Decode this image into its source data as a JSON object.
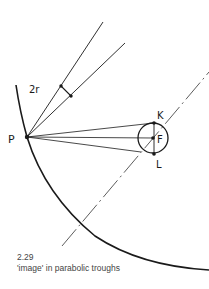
{
  "figure": {
    "number": "2.29",
    "caption": "'image' in parabolic troughs"
  },
  "labels": {
    "point_p": "P",
    "point_k": "K",
    "point_f": "F",
    "point_l": "L",
    "angle": "2r"
  },
  "elements": {
    "curve": "parabolic trough profile",
    "axis": "optical axis (dash-dot)",
    "receiver": "absorber tube circle at focus F",
    "rays": [
      "P to K",
      "P to F",
      "P to L"
    ],
    "incident_rays": [
      "outer incident ray",
      "inner incident ray"
    ]
  },
  "colors": {
    "ink": "#1a1a1a",
    "caption": "#444444",
    "background": "#ffffff"
  }
}
